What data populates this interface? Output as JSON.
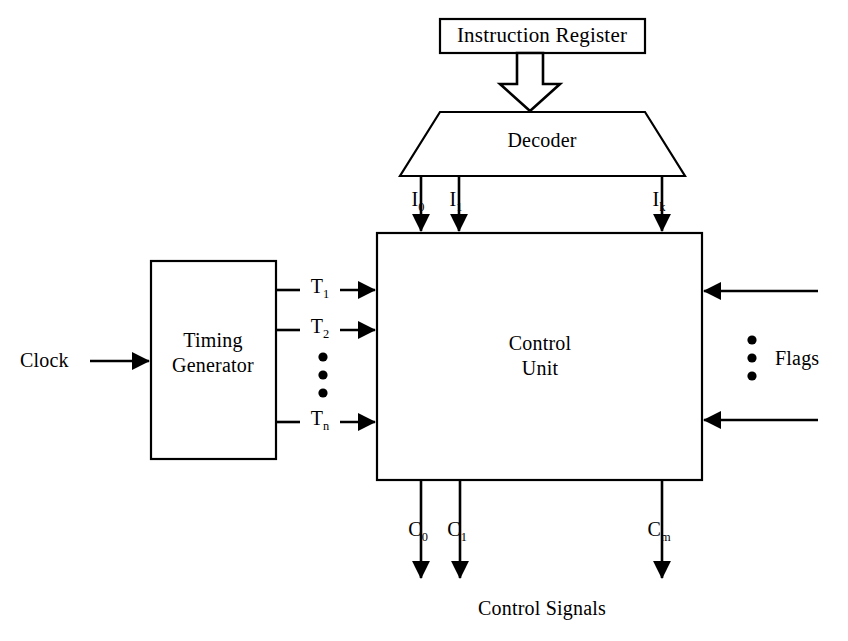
{
  "diagram": {
    "blocks": [
      {
        "id": "instruction-register",
        "label": "Instruction Register",
        "shape": "rectangle"
      },
      {
        "id": "decoder",
        "label": "Decoder",
        "shape": "trapezoid"
      },
      {
        "id": "control-unit",
        "label_line1": "Control",
        "label_line2": "Unit",
        "shape": "rectangle"
      },
      {
        "id": "timing-generator",
        "label_line1": "Timing",
        "label_line2": "Generator",
        "shape": "rectangle"
      }
    ],
    "decoder_outputs": [
      {
        "base": "I",
        "sub": "0"
      },
      {
        "base": "I",
        "sub": "1"
      },
      {
        "base": "I",
        "sub": "k"
      }
    ],
    "timing_signals": [
      {
        "base": "T",
        "sub": "1"
      },
      {
        "base": "T",
        "sub": "2"
      },
      {
        "base": "T",
        "sub": "n"
      }
    ],
    "control_outputs": [
      {
        "base": "C",
        "sub": "0"
      },
      {
        "base": "C",
        "sub": "1"
      },
      {
        "base": "C",
        "sub": "m"
      }
    ],
    "clock_label": "Clock",
    "flags_label": "Flags",
    "control_signals_label": "Control Signals",
    "ellipsis_glyph": "•",
    "colors": {
      "stroke": "#000000",
      "fill": "#ffffff",
      "background": "#ffffff"
    }
  }
}
